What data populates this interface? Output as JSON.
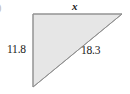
{
  "figure": {
    "kind": "right-triangle-geometry-figure",
    "background_color": "#ffffff",
    "fill_color": "#e6e6e6",
    "stroke_color": "#9a9a9a",
    "text_color": "#1a1a1a",
    "marker": ")",
    "labels": {
      "top_side": "x",
      "left_side": "11.8",
      "hypotenuse": "18.3"
    },
    "vertices": {
      "top_left": [
        33,
        14
      ],
      "top_right": [
        122,
        14
      ],
      "bottom_left": [
        33,
        87
      ]
    }
  },
  "chart_data": {
    "type": "diagram",
    "title": "",
    "shape": "right triangle",
    "right_angle_at": "top-left",
    "sides": [
      {
        "name": "top_leg",
        "label": "x",
        "value": null,
        "known": false,
        "orientation": "horizontal"
      },
      {
        "name": "left_leg",
        "label": "11.8",
        "value": 11.8,
        "known": true,
        "orientation": "vertical"
      },
      {
        "name": "hypotenuse",
        "label": "18.3",
        "value": 18.3,
        "known": true,
        "orientation": "diagonal"
      }
    ]
  }
}
